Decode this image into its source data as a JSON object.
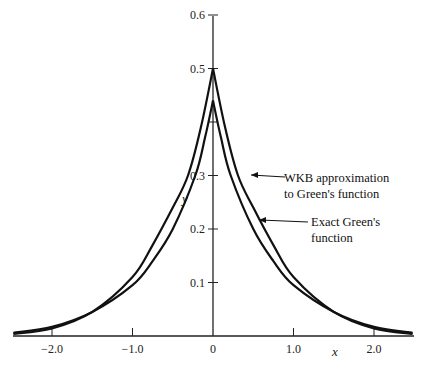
{
  "chart_data": {
    "type": "line",
    "title": "",
    "xlabel": "x",
    "ylabel": "y",
    "xlim": [
      -2.5,
      2.5
    ],
    "ylim": [
      0,
      0.6
    ],
    "grid": false,
    "x_ticks": [
      -2.0,
      -1.0,
      0,
      1.0,
      2.0
    ],
    "x_tick_labels": [
      "−2.0",
      "−1.0",
      "0",
      "1.0",
      "2.0"
    ],
    "y_ticks": [
      0.1,
      0.2,
      0.3,
      0.4,
      0.5,
      0.6
    ],
    "y_tick_labels": [
      "0.1",
      "0.2",
      "0.3",
      "",
      "0.5",
      "0.6"
    ],
    "series": [
      {
        "name": "WKB approximation to Green's function",
        "x": [
          -2.48,
          -2.0,
          -1.5,
          -1.0,
          -0.75,
          -0.5,
          -0.31,
          -0.15,
          0,
          0.15,
          0.31,
          0.5,
          0.75,
          1.0,
          1.5,
          2.0,
          2.48
        ],
        "y": [
          0.004,
          0.014,
          0.045,
          0.11,
          0.17,
          0.24,
          0.3,
          0.39,
          0.5,
          0.39,
          0.3,
          0.24,
          0.17,
          0.11,
          0.045,
          0.014,
          0.004
        ]
      },
      {
        "name": "Exact Green's function",
        "x": [
          -2.48,
          -2.0,
          -1.5,
          -1.0,
          -0.75,
          -0.5,
          -0.22,
          -0.1,
          0,
          0.1,
          0.22,
          0.5,
          0.75,
          1.0,
          1.5,
          2.0,
          2.48
        ],
        "y": [
          0.006,
          0.017,
          0.045,
          0.095,
          0.14,
          0.2,
          0.3,
          0.37,
          0.44,
          0.37,
          0.3,
          0.2,
          0.14,
          0.095,
          0.045,
          0.017,
          0.006
        ]
      }
    ],
    "annotations": [
      {
        "text_lines": [
          "WKB approximation",
          "to Green's function"
        ],
        "points_to_series": 0
      },
      {
        "text_lines": [
          "Exact Green's",
          "function"
        ],
        "points_to_series": 1
      }
    ]
  }
}
